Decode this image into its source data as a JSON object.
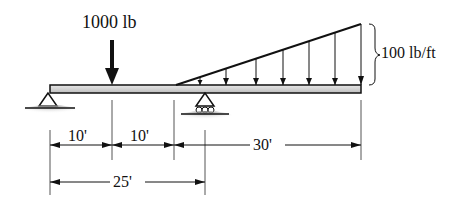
{
  "diagram": {
    "type": "beam-loading",
    "point_load": {
      "label": "1000 lb"
    },
    "distributed_load": {
      "label": "100 lb/ft",
      "shape": "triangular",
      "max_at": "right-end"
    },
    "supports": [
      {
        "type": "pin",
        "position": "left-end"
      },
      {
        "type": "roller",
        "position": "25 ft from left"
      }
    ],
    "dimensions": [
      {
        "label": "10'"
      },
      {
        "label": "10'"
      },
      {
        "label": "30'"
      },
      {
        "label": "25'"
      }
    ]
  }
}
